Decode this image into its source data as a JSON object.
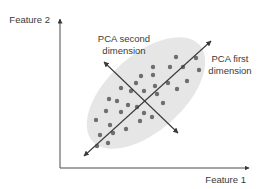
{
  "diagram": {
    "x_axis_label": "Feature 1",
    "y_axis_label": "Feature 2",
    "pca_first_label": [
      "PCA first",
      "dimension"
    ],
    "pca_second_label": [
      "PCA second",
      "dimension"
    ],
    "colors": {
      "axis": "#4a4a4a",
      "ellipse_fill": "#e6e6e6",
      "dot": "#6e6e6e",
      "arrow": "#3a3a3a",
      "text": "#3a3a3a"
    },
    "point_count": 34
  }
}
